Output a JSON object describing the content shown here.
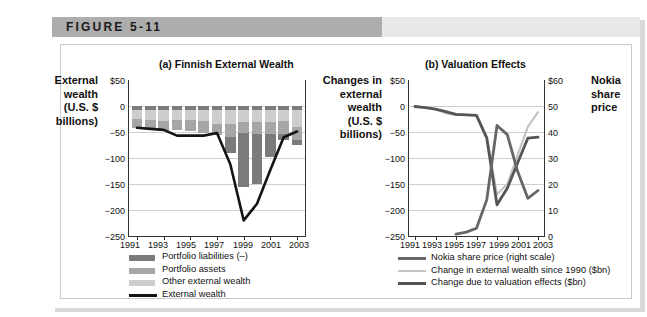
{
  "figure": {
    "label": "FIGURE 5-11"
  },
  "colors": {
    "portfolio_liabilities": "#7b7b7b",
    "portfolio_assets": "#a6a6a6",
    "other_external_wealth": "#cdcdcd",
    "external_wealth_line": "#141414",
    "nokia_line": "#666666",
    "change_wealth_line": "#c4c4c4",
    "valuation_line": "#555555",
    "grid": "#cfcfcf",
    "axis": "#333333",
    "title_bar_left": "#adadad",
    "title_bar_right": "#e8e8e8"
  },
  "panel_a": {
    "title": "(a) Finnish External Wealth",
    "y_axis_label": "External wealth (U.S. $ billions)",
    "y_axis_label_lines": [
      "External",
      "wealth",
      "(U.S. $",
      "billions)"
    ],
    "y_ticks": [
      "$50",
      "0",
      "−50",
      "−100",
      "−150",
      "−200",
      "−250"
    ],
    "x_ticks": [
      "1991",
      "1993",
      "1995",
      "1997",
      "1999",
      "2001",
      "2003"
    ],
    "legend": [
      {
        "label": "Portfolio liabilities (–)",
        "type": "swatch",
        "color": "#7b7b7b"
      },
      {
        "label": "Portfolio assets",
        "type": "swatch",
        "color": "#a6a6a6"
      },
      {
        "label": "Other external wealth",
        "type": "swatch",
        "color": "#cdcdcd"
      },
      {
        "label": "External wealth",
        "type": "line",
        "color": "#141414"
      }
    ]
  },
  "panel_b": {
    "title": "(b) Valuation Effects",
    "y_axis_label_lines": [
      "Changes in",
      "external",
      "wealth",
      "(U.S. $",
      "billions)"
    ],
    "y2_axis_label_lines": [
      "Nokia",
      "share",
      "price"
    ],
    "y_ticks": [
      "$50",
      "0",
      "−50",
      "−100",
      "−150",
      "−200",
      "−250"
    ],
    "y2_ticks": [
      "$60",
      "50",
      "40",
      "30",
      "20",
      "10",
      "0"
    ],
    "x_ticks": [
      "1991",
      "1993",
      "1995",
      "1997",
      "1999",
      "2001",
      "2003"
    ],
    "legend": [
      {
        "label": "Nokia share price (right scale)",
        "type": "line",
        "color": "#666666"
      },
      {
        "label": "Change in external wealth since 1990 ($bn)",
        "type": "line",
        "color": "#c4c4c4"
      },
      {
        "label": "Change due to valuation effects ($bn)",
        "type": "line",
        "color": "#555555"
      }
    ]
  },
  "chart_data": [
    {
      "type": "bar",
      "id": "panel_a",
      "title": "(a) Finnish External Wealth",
      "xlabel": "",
      "ylabel": "External wealth (U.S. $ billions)",
      "ylim": [
        -250,
        50
      ],
      "grid": true,
      "legend_position": "below",
      "categories": [
        1991,
        1992,
        1993,
        1994,
        1995,
        1996,
        1997,
        1998,
        1999,
        2000,
        2001,
        2002,
        2003
      ],
      "series": [
        {
          "name": "Portfolio liabilities (–)",
          "stacked": true,
          "color": "#7b7b7b",
          "values": [
            -8,
            -8,
            -14,
            -32,
            -30,
            -33,
            -28,
            -90,
            -155,
            -150,
            -98,
            -65,
            -75
          ]
        },
        {
          "name": "Portfolio assets",
          "stacked": true,
          "color": "#a6a6a6",
          "values": [
            16,
            16,
            18,
            18,
            20,
            22,
            22,
            25,
            20,
            22,
            22,
            24,
            26
          ]
        },
        {
          "name": "Other external wealth",
          "stacked": true,
          "color": "#cdcdcd",
          "values": [
            18,
            20,
            22,
            20,
            20,
            22,
            26,
            26,
            24,
            24,
            24,
            22,
            32
          ]
        }
      ],
      "line_series": [
        {
          "name": "External wealth",
          "color": "#141414",
          "x": [
            1991,
            1992,
            1993,
            1994,
            1995,
            1996,
            1997,
            1998,
            1999,
            2000,
            2001,
            2002,
            2003
          ],
          "y": [
            -42,
            -44,
            -46,
            -57,
            -57,
            -57,
            -52,
            -112,
            -220,
            -188,
            -123,
            -60,
            -49
          ]
        }
      ]
    },
    {
      "type": "line",
      "id": "panel_b",
      "title": "(b) Valuation Effects",
      "xlabel": "",
      "ylabel": "Changes in external wealth (U.S. $ billions)",
      "y2label": "Nokia share price",
      "ylim": [
        -250,
        50
      ],
      "y2lim": [
        0,
        60
      ],
      "grid": true,
      "legend_position": "below",
      "x": [
        1991,
        1992,
        1993,
        1994,
        1995,
        1996,
        1997,
        1998,
        1999,
        2000,
        2001,
        2002,
        2003
      ],
      "series": [
        {
          "name": "Nokia share price (right scale)",
          "axis": "right",
          "color": "#666666",
          "x": [
            1995,
            1996,
            1997,
            1998,
            1999,
            2000,
            2001,
            2002,
            2003
          ],
          "y": [
            0.7,
            1.5,
            3.0,
            14.0,
            42.5,
            39.0,
            25.0,
            14.5,
            17.5
          ]
        },
        {
          "name": "Change in external wealth since 1990 ($bn)",
          "axis": "left",
          "color": "#c4c4c4",
          "x": [
            1991,
            1992,
            1993,
            1994,
            1995,
            1996,
            1997,
            1998,
            1999,
            2000,
            2001,
            2002,
            2003
          ],
          "y": [
            -1,
            -3,
            -6,
            -14,
            -17,
            -17,
            -18,
            -60,
            -170,
            -150,
            -95,
            -40,
            -12
          ]
        },
        {
          "name": "Change due to valuation effects ($bn)",
          "axis": "left",
          "color": "#555555",
          "x": [
            1991,
            1992,
            1993,
            1994,
            1995,
            1996,
            1997,
            1998,
            1999,
            2000,
            2001,
            2002,
            2003
          ],
          "y": [
            -1,
            -3,
            -6,
            -11,
            -16,
            -17,
            -18,
            -62,
            -190,
            -158,
            -110,
            -62,
            -60
          ]
        }
      ]
    }
  ]
}
